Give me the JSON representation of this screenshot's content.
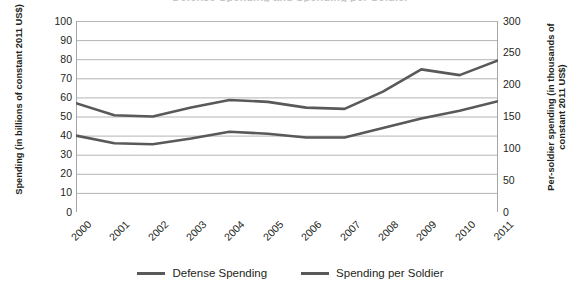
{
  "chart_data": {
    "type": "line",
    "title": "Defense Spending and Spending per Soldier",
    "xlabel": "",
    "ylabel": "Spending (in billions of constant 2011 US$)",
    "y2label": "Per-soldier spending (in thousands of constant 2011 US$)",
    "categories": [
      "2000",
      "2001",
      "2002",
      "2003",
      "2004",
      "2005",
      "2006",
      "2007",
      "2008",
      "2009",
      "2010",
      "2011"
    ],
    "ylim": [
      0,
      100
    ],
    "y2lim": [
      0,
      300
    ],
    "yticks": [
      0,
      10,
      20,
      30,
      40,
      50,
      60,
      70,
      80,
      90,
      100
    ],
    "y2ticks": [
      0,
      50,
      100,
      150,
      200,
      250,
      300
    ],
    "grid": true,
    "legend_position": "bottom",
    "series": [
      {
        "name": "Defense Spending",
        "axis": "left",
        "color": "#595959",
        "values": [
          40,
          36,
          35.5,
          38.5,
          42,
          41,
          39,
          39,
          44,
          49,
          53,
          58
        ]
      },
      {
        "name": "Spending per Soldier",
        "axis": "right",
        "color": "#595959",
        "values": [
          171,
          152,
          150,
          164,
          176,
          173,
          164,
          162,
          189,
          224,
          215,
          238
        ]
      }
    ]
  },
  "axes": {
    "left_title": "Spending (in billions of constant 2011 US$)",
    "right_title": "Per-soldier spending (in thousands of constant 2011 US$)"
  },
  "legend": {
    "items": [
      {
        "label": "Defense Spending"
      },
      {
        "label": "Spending per Soldier"
      }
    ]
  },
  "style": {
    "line_color": "#595959",
    "grid_color": "#b4b4b4",
    "axis_color": "#a6a6a6",
    "text_color": "#231f20",
    "background": "#ffffff"
  }
}
